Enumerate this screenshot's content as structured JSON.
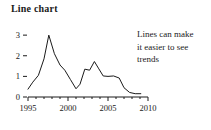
{
  "title": "Line chart",
  "annotation": {
    "lines": [
      "Lines can make",
      "it easier to see",
      "trends"
    ]
  },
  "colors": {
    "line": "#1a1a1a",
    "axis": "#1a1a1a",
    "text": "#1a1a1a",
    "background": "#ffffff"
  },
  "chart_data": {
    "type": "line",
    "title": "Line chart",
    "xlabel": "",
    "ylabel": "",
    "xlim": [
      1995,
      2010
    ],
    "ylim": [
      0,
      3.2
    ],
    "grid": false,
    "legend": null,
    "x_ticks": [
      1995,
      2000,
      2005,
      2010
    ],
    "x_tick_labels": [
      "1995",
      "2000",
      "2005",
      "2010"
    ],
    "x_minor_tick_step": 1,
    "y_ticks": [
      0,
      1,
      2,
      3
    ],
    "y_tick_labels": [
      "0",
      "1",
      "2",
      "3"
    ],
    "series": [
      {
        "name": "series-1",
        "x": [
          1995.0,
          1995.6,
          1996.3,
          1997.0,
          1997.6,
          1998.3,
          1999.0,
          1999.6,
          2000.3,
          2001.0,
          2001.5,
          2002.1,
          2002.7,
          2003.3,
          2003.8,
          2004.4,
          2005.0,
          2005.7,
          2006.4,
          2007.0,
          2007.7,
          2008.4,
          2009.1
        ],
        "y": [
          0.38,
          0.72,
          1.05,
          1.85,
          3.0,
          2.1,
          1.55,
          1.3,
          0.85,
          0.4,
          0.62,
          1.35,
          1.3,
          1.72,
          1.4,
          1.02,
          1.0,
          1.02,
          0.92,
          0.45,
          0.22,
          0.16,
          0.16
        ]
      }
    ]
  }
}
